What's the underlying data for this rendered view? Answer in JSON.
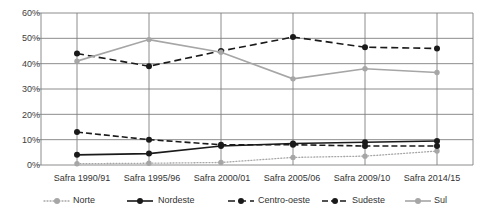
{
  "chart_data": {
    "type": "line",
    "title": "",
    "subtitle": "",
    "xlabel": "",
    "ylabel": "",
    "ylim": [
      0,
      60
    ],
    "yticks": [
      0,
      10,
      20,
      30,
      40,
      50,
      60
    ],
    "ytick_labels": [
      "0%",
      "10%",
      "20%",
      "30%",
      "40%",
      "50%",
      "60%"
    ],
    "grid": true,
    "legend_position": "bottom",
    "categories": [
      "Safra 1990/91",
      "Safra 1995/96",
      "Safra 2000/01",
      "Safra 2005/06",
      "Safra 2009/10",
      "Safra 2014/15"
    ],
    "series": [
      {
        "name": "Norte",
        "values": [
          0.5,
          0.7,
          1.0,
          3.0,
          3.5,
          5.5
        ],
        "color": "#A6A6A6",
        "style": "dotted",
        "marker": "circle"
      },
      {
        "name": "Nordeste",
        "values": [
          4.0,
          4.5,
          7.5,
          8.5,
          9.0,
          9.5
        ],
        "color": "#1A1A1A",
        "style": "solid",
        "marker": "circle"
      },
      {
        "name": "Centro-oeste",
        "values": [
          44.0,
          39.0,
          45.0,
          50.5,
          46.5,
          46.0
        ],
        "color": "#1A1A1A",
        "style": "dashed",
        "marker": "circle"
      },
      {
        "name": "Sudeste",
        "values": [
          13.0,
          10.0,
          8.0,
          8.0,
          7.5,
          7.5
        ],
        "color": "#1A1A1A",
        "style": "dashed-long",
        "marker": "circle"
      },
      {
        "name": "Sul",
        "values": [
          41.0,
          49.5,
          44.5,
          34.0,
          38.0,
          36.5
        ],
        "color": "#A6A6A6",
        "style": "solid",
        "marker": "circle"
      }
    ]
  },
  "axis": {
    "ticks": [
      {
        "label": "60%"
      },
      {
        "label": "50%"
      },
      {
        "label": "40%"
      },
      {
        "label": "30%"
      },
      {
        "label": "20%"
      },
      {
        "label": "10%"
      },
      {
        "label": "0%"
      }
    ]
  },
  "legend": {
    "items": [
      {
        "label": "Norte"
      },
      {
        "label": "Nordeste"
      },
      {
        "label": "Centro-oeste"
      },
      {
        "label": "Sudeste"
      },
      {
        "label": "Sul"
      }
    ]
  }
}
